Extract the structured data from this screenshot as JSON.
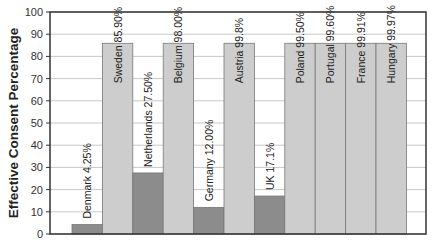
{
  "chart_data": {
    "type": "bar",
    "title": "",
    "xlabel": "",
    "ylabel": "Effective Consent Percentage",
    "ylim": [
      0,
      100
    ],
    "yticks": [
      0,
      10,
      20,
      30,
      40,
      50,
      60,
      70,
      80,
      90,
      100
    ],
    "grid": true,
    "legend": null,
    "categories": [
      "Denmark",
      "Sweden",
      "Netherlands",
      "Belgium",
      "Germany",
      "Austria",
      "UK",
      "Poland",
      "Portugal",
      "France",
      "Hungary"
    ],
    "values": [
      4.25,
      85.9,
      27.5,
      98.0,
      12.0,
      99.8,
      17.1,
      99.5,
      99.6,
      99.91,
      99.97
    ],
    "display_heights": [
      4.25,
      85.9,
      27.5,
      85.9,
      12.0,
      85.9,
      17.1,
      85.9,
      85.9,
      85.9,
      85.9
    ],
    "labels": [
      "Denmark 4.25%",
      "Sweden 85.90%",
      "Netherlands 27.50%",
      "Belgium 98.00%",
      "Germany 12.00%",
      "Austria 99.8%",
      "UK 17.1%",
      "Poland 99.50%",
      "Portugal 99.60%",
      "France 99.91%",
      "Hungary 99.97%"
    ],
    "bar_colors": [
      "#8c8c8c",
      "#cdcdcd",
      "#8c8c8c",
      "#cdcdcd",
      "#8c8c8c",
      "#cdcdcd",
      "#8c8c8c",
      "#cdcdcd",
      "#cdcdcd",
      "#cdcdcd",
      "#cdcdcd"
    ]
  }
}
